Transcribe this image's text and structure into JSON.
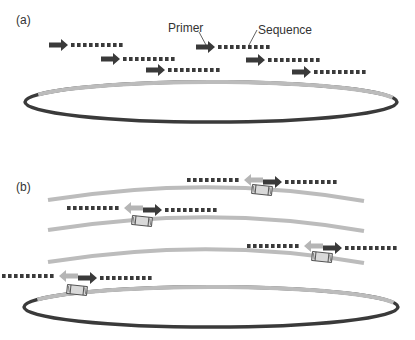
{
  "colors": {
    "dark": "#3a3a3a",
    "light_strand": "#bcbcbc",
    "reverse_primer": "#b5b5b5",
    "barcode_fill": "#d9d9d9",
    "barcode_stroke": "#4a4a4a",
    "text": "#333333"
  },
  "panel_a": {
    "label": "(a)",
    "callouts": {
      "primer": "Primer",
      "sequence": "Sequence"
    },
    "reads": [
      {
        "x": 49,
        "y": 45
      },
      {
        "x": 101,
        "y": 59
      },
      {
        "x": 146,
        "y": 70
      },
      {
        "x": 196,
        "y": 47
      },
      {
        "x": 246,
        "y": 60
      },
      {
        "x": 292,
        "y": 72
      }
    ],
    "circle": {
      "cx": 211,
      "cy": 102,
      "rx": 186,
      "ry": 20
    }
  },
  "panel_b": {
    "label": "(b)",
    "strands": [
      {
        "y0": 200,
        "ymid": 188,
        "y1": 201
      },
      {
        "y0": 230,
        "ymid": 218,
        "y1": 231
      },
      {
        "y0": 262,
        "ymid": 250,
        "y1": 263
      }
    ],
    "amplicons": [
      {
        "cx": 262,
        "y": 180,
        "box_y": 190
      },
      {
        "cx": 142,
        "y": 208,
        "box_y": 221
      },
      {
        "cx": 322,
        "y": 246,
        "box_y": 257
      },
      {
        "cx": 77,
        "y": 276,
        "box_y": 290
      }
    ],
    "circle": {
      "cx": 211,
      "cy": 307,
      "rx": 187,
      "ry": 20
    }
  }
}
